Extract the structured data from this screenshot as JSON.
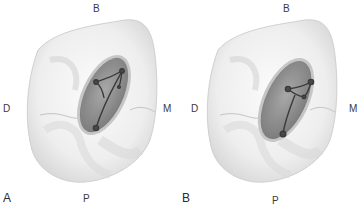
{
  "figure": {
    "panels": [
      {
        "id": "A",
        "label": "A",
        "orientation": {
          "top": "B",
          "left": "D",
          "right": "M",
          "bottom": "P"
        }
      },
      {
        "id": "B",
        "label": "B",
        "orientation": {
          "top": "B",
          "left": "D",
          "right": "M",
          "bottom": "P"
        }
      }
    ],
    "colors": {
      "tooth": "#f2f2f2",
      "tooth_shadow": "#d6d6d6",
      "access_cavity": "#8e8e8e",
      "cavity_rim": "#c8c8c8",
      "canal_lines": "#3d3d3d"
    }
  }
}
